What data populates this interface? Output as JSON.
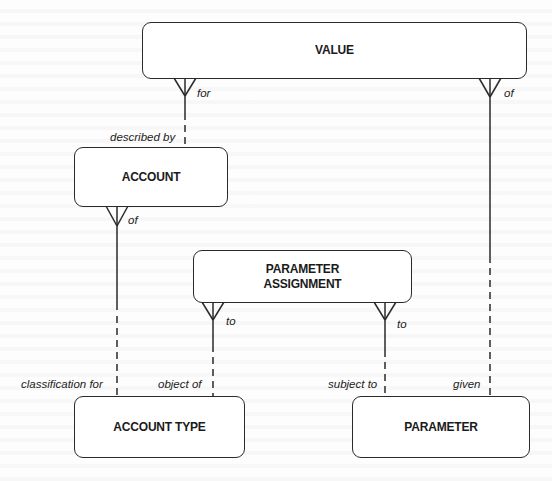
{
  "diagram": {
    "type": "entity-relationship",
    "entities": [
      {
        "id": "value",
        "label": "VALUE"
      },
      {
        "id": "account",
        "label": "ACCOUNT"
      },
      {
        "id": "parameter_assignment",
        "label": "PARAMETER\nASSIGNMENT"
      },
      {
        "id": "account_type",
        "label": "ACCOUNT TYPE"
      },
      {
        "id": "parameter",
        "label": "PARAMETER"
      }
    ],
    "relationships": [
      {
        "from": "value",
        "to": "account",
        "from_label": "for",
        "to_label": "described by",
        "many_end": "value"
      },
      {
        "from": "value",
        "to": "parameter",
        "from_label": "of",
        "to_label": "given",
        "many_end": "value"
      },
      {
        "from": "account",
        "to": "account_type",
        "from_label": "of",
        "to_label": "classification for",
        "many_end": "account"
      },
      {
        "from": "parameter_assignment",
        "to": "account_type",
        "from_label": "to",
        "to_label": "object of",
        "many_end": "parameter_assignment"
      },
      {
        "from": "parameter_assignment",
        "to": "parameter",
        "from_label": "to",
        "to_label": "subject to",
        "many_end": "parameter_assignment"
      }
    ]
  },
  "labels": {
    "value_for": "for",
    "value_of": "of",
    "described_by": "described by",
    "account_of": "of",
    "pa_to_left": "to",
    "pa_to_right": "to",
    "classification_for": "classification for",
    "object_of": "object of",
    "subject_to": "subject to",
    "given": "given"
  },
  "colors": {
    "line": "#2a2a2a",
    "text": "#1a1a1a",
    "background": "#ffffff"
  }
}
